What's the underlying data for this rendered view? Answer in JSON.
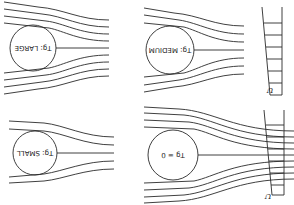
{
  "diagram": {
    "orientation": "rotated 180 degrees",
    "panels": [
      {
        "id": "large",
        "label": "Tg: LARGE",
        "circle": {
          "cx": 33,
          "cy": 48,
          "r": 23
        },
        "has_profile": false
      },
      {
        "id": "medium",
        "label": "Tg: MEDIUM",
        "circle": {
          "cx": 170,
          "cy": 50,
          "r": 24
        },
        "has_profile": true
      },
      {
        "id": "small",
        "label": "Tg: SMALL",
        "circle": {
          "cx": 35,
          "cy": 153,
          "r": 22
        },
        "has_profile": false
      },
      {
        "id": "zero",
        "label": "Tg = 0",
        "circle": {
          "cx": 173,
          "cy": 155,
          "r": 25
        },
        "has_profile": true
      }
    ],
    "profile_label": "U",
    "line_color": "#2a2a2a"
  }
}
